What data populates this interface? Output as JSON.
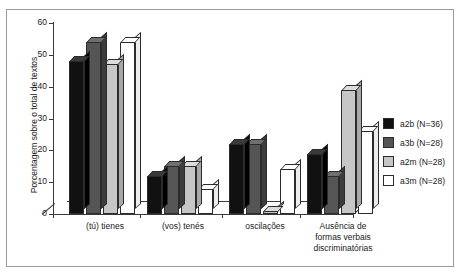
{
  "figure": {
    "top_caption": "",
    "frame_border_color": "#9a9a9a",
    "background": "#ffffff"
  },
  "chart_data": {
    "type": "bar",
    "title": "",
    "xlabel": "",
    "ylabel": "Porcentagem sobre o total de textos",
    "ylim": [
      0,
      60
    ],
    "yticks": [
      0,
      10,
      20,
      30,
      40,
      50,
      60
    ],
    "grid": false,
    "legend_position": "right",
    "style": "3d-clustered-column",
    "categories": [
      "(tú) tienes",
      "(vos) tenés",
      "oscilações",
      "Ausência de formas verbais discriminatórias"
    ],
    "category_lines": [
      [
        "(tú) tienes"
      ],
      [
        "(vos) tenés"
      ],
      [
        "oscilações"
      ],
      [
        "Ausência de",
        "formas verbais",
        "discriminatórias"
      ]
    ],
    "series": [
      {
        "name": "a2b (N=36)",
        "color": "#111111",
        "values": [
          48,
          12,
          22,
          19
        ]
      },
      {
        "name": "a3b (N=28)",
        "color": "#555555",
        "values": [
          54,
          15,
          22,
          12
        ]
      },
      {
        "name": "a2m (N=28)",
        "color": "#c6c6c6",
        "values": [
          47,
          15,
          1,
          39
        ]
      },
      {
        "name": "a3m (N=28)",
        "color": "#ffffff",
        "values": [
          54,
          8,
          14,
          26
        ]
      }
    ]
  },
  "legend": {
    "items": [
      {
        "label": "a2b (N=36)",
        "color": "#111111"
      },
      {
        "label": "a3b (N=28)",
        "color": "#555555"
      },
      {
        "label": "a2m (N=28)",
        "color": "#c6c6c6"
      },
      {
        "label": "a3m (N=28)",
        "color": "#ffffff"
      }
    ]
  }
}
